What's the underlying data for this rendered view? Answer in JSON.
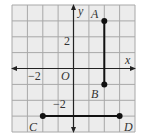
{
  "diagram": {
    "type": "coordinate-grid",
    "grid": {
      "x_min": -4,
      "x_max": 4,
      "y_min": -4,
      "y_max": 4,
      "background": "#ececec",
      "line_color": "#a8a8a8"
    },
    "axes": {
      "x_label": "x",
      "y_label": "y",
      "origin_label": "O",
      "x_tick_label": "−2",
      "y_tick_label_pos": "2",
      "y_tick_label_neg": "−2"
    },
    "points": [
      {
        "name": "A",
        "x": 2,
        "y": 3
      },
      {
        "name": "B",
        "x": 2,
        "y": -1
      },
      {
        "name": "C",
        "x": -2,
        "y": -3
      },
      {
        "name": "D",
        "x": 3,
        "y": -3
      }
    ],
    "segments": [
      {
        "from": "A",
        "to": "B"
      },
      {
        "from": "C",
        "to": "D"
      }
    ]
  }
}
